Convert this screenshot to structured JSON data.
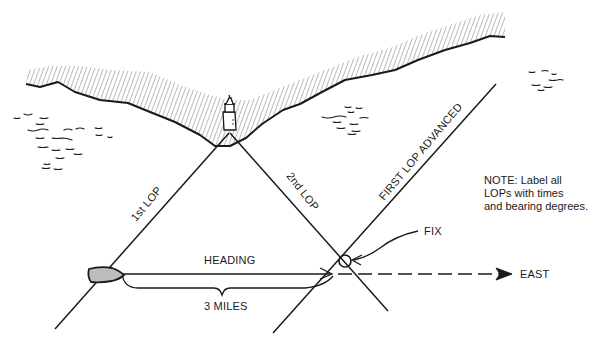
{
  "diagram": {
    "type": "navigation-fix-running",
    "colors": {
      "ink": "#1a1a1a",
      "boat_fill": "#bdbdbd",
      "background": "#ffffff"
    },
    "labels": {
      "first_lop": "1st LOP",
      "second_lop": "2nd LOP",
      "first_lop_advanced": "FIRST LOP ADVANCED",
      "heading": "HEADING",
      "distance": "3 MILES",
      "fix": "FIX",
      "direction": "EAST"
    },
    "note": {
      "lines": [
        "NOTE: Label all",
        "LOPs with times",
        "and bearing degrees."
      ]
    },
    "icons": {
      "landmark": "lighthouse-icon",
      "vessel": "boat-icon"
    }
  }
}
